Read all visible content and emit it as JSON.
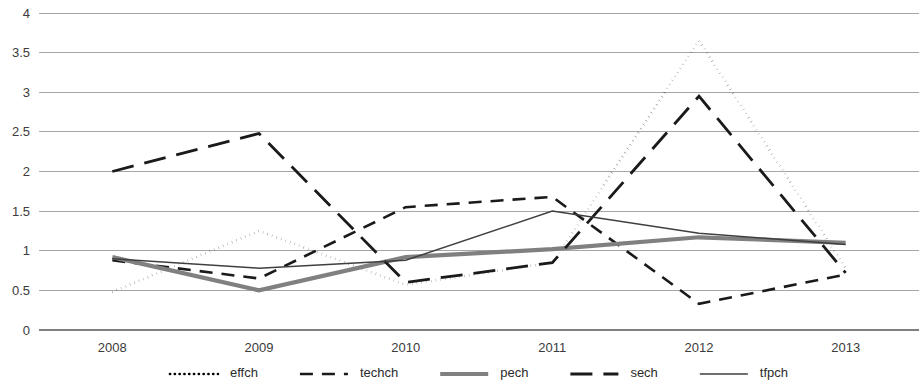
{
  "chart_data": {
    "type": "line",
    "title": "",
    "subtitle": "",
    "xlabel": "",
    "ylabel": "",
    "categories": [
      "2008",
      "2009",
      "2010",
      "2011",
      "2012",
      "2013"
    ],
    "x_tick_labels": [
      "2008",
      "2009",
      "2010",
      "2011",
      "2012",
      "2013"
    ],
    "y_tick_labels": [
      "0",
      "0.5",
      "1",
      "1.5",
      "2",
      "2.5",
      "3",
      "3.5",
      "4"
    ],
    "y_ticks": [
      0,
      0.5,
      1,
      1.5,
      2,
      2.5,
      3,
      3.5,
      4
    ],
    "ylim": [
      0,
      4
    ],
    "grid": "horizontal",
    "legend_position": "bottom",
    "series": [
      {
        "name": "effch",
        "style": "dotted",
        "color": "#000000",
        "width": 2.6,
        "dash": "0.2,4.6",
        "values": [
          0.48,
          1.25,
          0.57,
          0.85,
          3.65,
          0.78
        ]
      },
      {
        "name": "techch",
        "style": "dashed",
        "color": "#1a1a1a",
        "width": 2.6,
        "dash": "13,9",
        "values": [
          0.88,
          0.65,
          1.55,
          1.68,
          0.33,
          0.7
        ]
      },
      {
        "name": "pech",
        "style": "solid-thick",
        "color": "#808080",
        "width": 4.2,
        "dash": "none",
        "values": [
          0.92,
          0.5,
          0.92,
          1.02,
          1.17,
          1.1
        ]
      },
      {
        "name": "sech",
        "style": "long-dashed",
        "color": "#1a1a1a",
        "width": 2.8,
        "dash": "22,11",
        "values": [
          2.0,
          2.48,
          0.6,
          0.85,
          2.95,
          0.72
        ]
      },
      {
        "name": "tfpch",
        "style": "solid-thin",
        "color": "#3f3f3f",
        "width": 1.5,
        "dash": "none",
        "values": [
          0.9,
          0.78,
          0.88,
          1.5,
          1.22,
          1.08
        ]
      }
    ],
    "legend": [
      {
        "label": "effch",
        "style": "dotted",
        "color": "#000000"
      },
      {
        "label": "techch",
        "style": "dashed",
        "color": "#1a1a1a"
      },
      {
        "label": "pech",
        "style": "solid-thick",
        "color": "#808080"
      },
      {
        "label": "sech",
        "style": "long-dashed",
        "color": "#1a1a1a"
      },
      {
        "label": "tfpch",
        "style": "solid-thin",
        "color": "#3f3f3f"
      }
    ],
    "colors": {
      "gridline": "#a6a6a6",
      "axis": "#7f7f7f",
      "text": "#3b3b3b",
      "background": "#ffffff"
    }
  }
}
